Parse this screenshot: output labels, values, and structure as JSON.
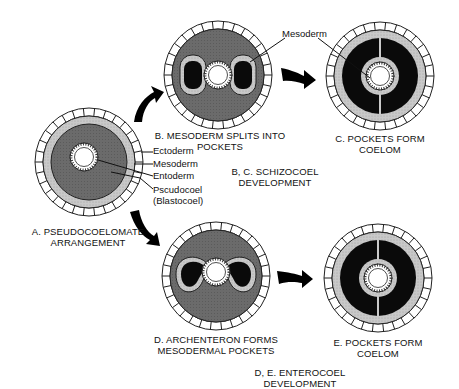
{
  "colors": {
    "background": "#ffffff",
    "ectoderm_fill": "#ffffff",
    "ectoderm_stroke": "#222222",
    "mesoderm_fill": "#c8c8c8",
    "pseudocoel_fill": "#6a6a6a",
    "coelom_fill": "#0a0a0a",
    "entoderm_fill": "#ffffff",
    "arrow": "#000000"
  },
  "panels": {
    "a": {
      "caption_line1": "A. PSEUDOCOELOMATE",
      "caption_line2": "ARRANGEMENT",
      "labels": {
        "ectoderm": "Ectoderm",
        "mesoderm": "Mesoderm",
        "entoderm": "Entoderm",
        "pseudocoel": "Pscudocoel",
        "blastocoel": "(Blastocoel)"
      }
    },
    "b": {
      "caption_line1": "B.  MESODERM SPLITS INTO",
      "caption_line2": "POCKETS"
    },
    "c": {
      "caption_line1": "C. POCKETS FORM",
      "caption_line2": "COELOM",
      "label_mesoderm": "Mesoderm"
    },
    "d": {
      "caption_line1": "D. ARCHENTERON FORMS",
      "caption_line2": "MESODERMAL POCKETS"
    },
    "e": {
      "caption_line1": "E. POCKETS FORM",
      "caption_line2": "COELOM"
    }
  },
  "groups": {
    "bc": {
      "line1": "B, C. SCHIZOCOEL",
      "line2": "DEVELOPMENT"
    },
    "de": {
      "line1": "D, E. ENTEROCOEL",
      "line2": "DEVELOPMENT"
    }
  }
}
